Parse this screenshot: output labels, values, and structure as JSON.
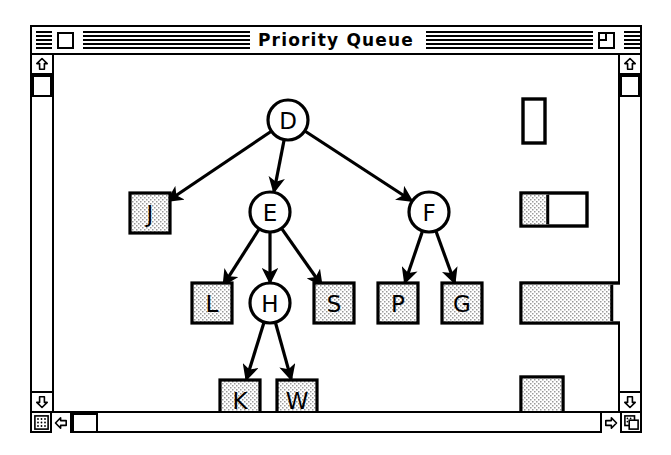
{
  "window": {
    "title": "Priority Queue",
    "close_box": "close-box",
    "zoom_box": "zoom-box",
    "grow_box": "grow-box",
    "size_box": "size-box"
  },
  "scrollbars": {
    "vertical_left": {
      "up_arrow": "▲",
      "down_arrow": "▼",
      "thumb_position_pct": 2
    },
    "vertical_right": {
      "up_arrow": "▲",
      "down_arrow": "▼",
      "thumb_position_pct": 2
    },
    "horizontal": {
      "left_arrow": "◀",
      "right_arrow": "▶",
      "thumb_position_pct": 1
    }
  },
  "diagram": {
    "type": "tree",
    "caption": "Priority Queue heap tree",
    "nodes": [
      {
        "id": "D",
        "label": "D",
        "shape": "circle",
        "fill": "white",
        "cx": 256,
        "cy": 95
      },
      {
        "id": "J",
        "label": "J",
        "shape": "square",
        "fill": "stipple",
        "cx": 118,
        "cy": 188
      },
      {
        "id": "E",
        "label": "E",
        "shape": "circle",
        "fill": "white",
        "cx": 238,
        "cy": 187
      },
      {
        "id": "F",
        "label": "F",
        "shape": "circle",
        "fill": "white",
        "cx": 397,
        "cy": 187
      },
      {
        "id": "L",
        "label": "L",
        "shape": "square",
        "fill": "stipple",
        "cx": 180,
        "cy": 278
      },
      {
        "id": "H",
        "label": "H",
        "shape": "circle",
        "fill": "white",
        "cx": 238,
        "cy": 278
      },
      {
        "id": "S",
        "label": "S",
        "shape": "square",
        "fill": "stipple",
        "cx": 302,
        "cy": 278
      },
      {
        "id": "P",
        "label": "P",
        "shape": "square",
        "fill": "stipple",
        "cx": 366,
        "cy": 278
      },
      {
        "id": "G",
        "label": "G",
        "shape": "square",
        "fill": "stipple",
        "cx": 430,
        "cy": 278
      },
      {
        "id": "K",
        "label": "K",
        "shape": "square",
        "fill": "stipple",
        "cx": 208,
        "cy": 375
      },
      {
        "id": "W",
        "label": "W",
        "shape": "square",
        "fill": "stipple",
        "cx": 265,
        "cy": 375
      }
    ],
    "edges": [
      {
        "from": "D",
        "to": "J"
      },
      {
        "from": "D",
        "to": "E"
      },
      {
        "from": "D",
        "to": "F"
      },
      {
        "from": "E",
        "to": "L"
      },
      {
        "from": "E",
        "to": "H"
      },
      {
        "from": "E",
        "to": "S"
      },
      {
        "from": "F",
        "to": "P"
      },
      {
        "from": "F",
        "to": "G"
      },
      {
        "from": "H",
        "to": "K"
      },
      {
        "from": "H",
        "to": "W"
      }
    ]
  },
  "gauges": [
    {
      "name": "vertical-indicator",
      "orientation": "vertical",
      "fill_pct": 0,
      "x": 491,
      "y": 74,
      "w": 22,
      "h": 44
    },
    {
      "name": "small-progress-bar",
      "orientation": "horizontal",
      "fill_pct": 40,
      "x": 489,
      "y": 168,
      "w": 66,
      "h": 33
    },
    {
      "name": "large-progress-bar",
      "orientation": "horizontal",
      "fill_pct": 82,
      "x": 489,
      "y": 258,
      "w": 112,
      "h": 40
    },
    {
      "name": "filled-square",
      "orientation": "square",
      "fill_pct": 100,
      "x": 489,
      "y": 352,
      "w": 42,
      "h": 40
    }
  ]
}
